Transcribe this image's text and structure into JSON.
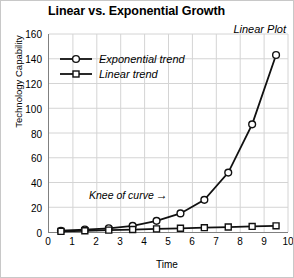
{
  "chart_data": {
    "type": "line",
    "title": "Linear vs. Exponential Growth",
    "corner_label": "Linear Plot",
    "xlabel": "Time",
    "ylabel": "Technology Capability",
    "xlim": [
      0,
      10
    ],
    "ylim": [
      0,
      160
    ],
    "x_ticks": [
      0,
      1,
      2,
      3,
      4,
      5,
      6,
      7,
      8,
      9,
      10
    ],
    "y_ticks": [
      0,
      20,
      40,
      60,
      80,
      100,
      120,
      140,
      160
    ],
    "grid": true,
    "legend_position": "upper-left-inside",
    "x": [
      0.5,
      1.5,
      2.5,
      3.5,
      4.5,
      5.5,
      6.5,
      7.5,
      8.5,
      9.5
    ],
    "series": [
      {
        "name": "Exponential trend",
        "marker": "circle",
        "values": [
          1,
          2,
          3,
          5,
          9,
          15,
          26,
          48,
          87,
          143
        ]
      },
      {
        "name": "Linear trend",
        "marker": "square",
        "values": [
          0.5,
          1,
          1.5,
          2,
          2.5,
          3,
          3.5,
          4,
          4.5,
          5
        ]
      }
    ],
    "annotations": [
      {
        "text": "Knee of curve",
        "arrow": "→",
        "points_to_x": 6.5,
        "points_to_y": 26
      }
    ],
    "colors": {
      "line": "#111111",
      "marker_fill": "#ffffff",
      "grid": "#d4d4d4",
      "axis": "#808080",
      "text": "#000000"
    }
  }
}
